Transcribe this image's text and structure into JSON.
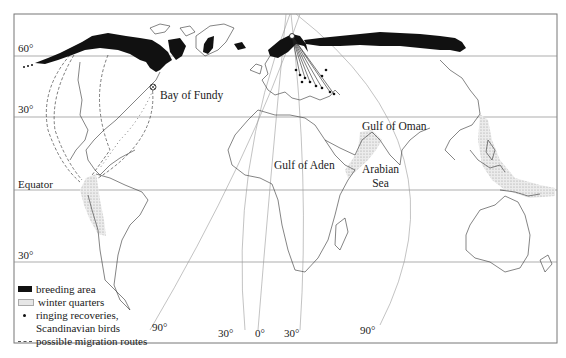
{
  "map": {
    "title": "Breeding area, winter quarters and migration routes",
    "frame": {
      "left": 14,
      "top": 14,
      "right": 557,
      "bottom": 343
    },
    "colors": {
      "breeding": "#111111",
      "winter": "#d9d9d9",
      "coast": "#333333",
      "grid": "#9a9a9a",
      "frame": "#777777"
    },
    "latitude_labels": [
      {
        "id": "lat-60n",
        "text": "60°",
        "y": 56
      },
      {
        "id": "lat-30n",
        "text": "30°",
        "y": 117
      },
      {
        "id": "lat-eq",
        "text": "Equator",
        "y": 190
      },
      {
        "id": "lat-30s",
        "text": "30°",
        "y": 262
      }
    ],
    "longitude_labels": [
      {
        "id": "lon-90w",
        "text": "90°"
      },
      {
        "id": "lon-30w",
        "text": "30°"
      },
      {
        "id": "lon-0",
        "text": "0°"
      },
      {
        "id": "lon-30e",
        "text": "30°"
      },
      {
        "id": "lon-90e",
        "text": "90°"
      }
    ],
    "place_labels": {
      "bay_of_fundy": "Bay of Fundy",
      "gulf_of_oman": "Gulf of Oman",
      "gulf_of_aden": "Gulf of Aden",
      "arabian_sea_1": "Arabian",
      "arabian_sea_2": "Sea"
    }
  },
  "legend": {
    "breeding": "breeding area",
    "winter": "winter quarters",
    "ringing_1": "ringing recoveries,",
    "ringing_2": "Scandinavian birds",
    "routes": "possible migration routes"
  }
}
